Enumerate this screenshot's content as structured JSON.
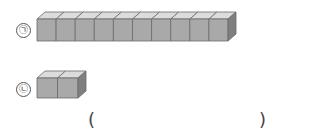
{
  "items": [
    {
      "label": "㉠",
      "cube_count": 10
    },
    {
      "label": "㉡",
      "cube_count": 2
    }
  ],
  "answer": {
    "open": "(",
    "close": ")",
    "value": ""
  },
  "colors": {
    "front": "#a9a9a9",
    "top": "#dcdcdc",
    "side": "#7f7f7f",
    "edge": "#6a6a6a"
  }
}
